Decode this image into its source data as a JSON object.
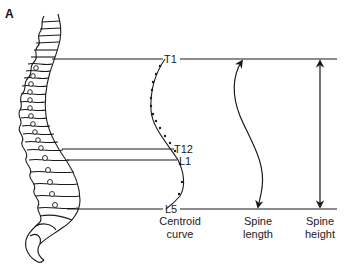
{
  "figure": {
    "panel_label": "A",
    "levels": [
      {
        "id": "t1",
        "label": "T1",
        "y": 59
      },
      {
        "id": "t12",
        "label": "T12",
        "y": 149
      },
      {
        "id": "l1",
        "label": "L1",
        "y": 160
      },
      {
        "id": "l5",
        "label": "L5",
        "y": 209
      }
    ],
    "captions": {
      "centroid": {
        "line1": "Centroid",
        "line2": "curve"
      },
      "length": {
        "line1": "Spine",
        "line2": "length"
      },
      "height": {
        "line1": "Spine",
        "line2": "height"
      }
    },
    "colors": {
      "stroke": "#1a1a1a",
      "background": "#ffffff"
    }
  }
}
